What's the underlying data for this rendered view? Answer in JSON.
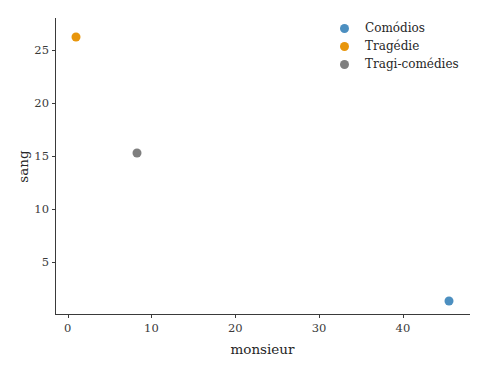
{
  "chart_data": {
    "type": "scatter",
    "title": "",
    "xlabel": "monsieur",
    "ylabel": "sang",
    "xlim": [
      -1.5,
      48
    ],
    "ylim": [
      0,
      28
    ],
    "xticks": [
      0,
      10,
      20,
      30,
      40
    ],
    "yticks": [
      5,
      10,
      15,
      20,
      25
    ],
    "xtick_labels": [
      "0",
      "10",
      "20",
      "30",
      "40"
    ],
    "ytick_labels": [
      "5",
      "10",
      "15",
      "20",
      "25"
    ],
    "grid": false,
    "legend_position": "upper right",
    "series": [
      {
        "name": "Comódios",
        "color": "#4c8fc0",
        "points": [
          {
            "x": 45.5,
            "y": 1.3
          }
        ]
      },
      {
        "name": "Tragédie",
        "color": "#e8960c",
        "points": [
          {
            "x": 1.0,
            "y": 26.2
          }
        ]
      },
      {
        "name": "Tragi-comédies",
        "color": "#7f7f7f",
        "points": [
          {
            "x": 8.3,
            "y": 15.3
          }
        ]
      }
    ]
  },
  "legend": {
    "entries": [
      {
        "label": "Comódios",
        "color": "#4c8fc0"
      },
      {
        "label": "Tragédie",
        "color": "#e8960c"
      },
      {
        "label": "Tragi-comédies",
        "color": "#7f7f7f"
      }
    ]
  },
  "axes": {
    "x_title": "monsieur",
    "y_title": "sang"
  },
  "colors": {
    "background": "#ffffff",
    "axis": "#3a3a3a",
    "text": "#262626"
  }
}
